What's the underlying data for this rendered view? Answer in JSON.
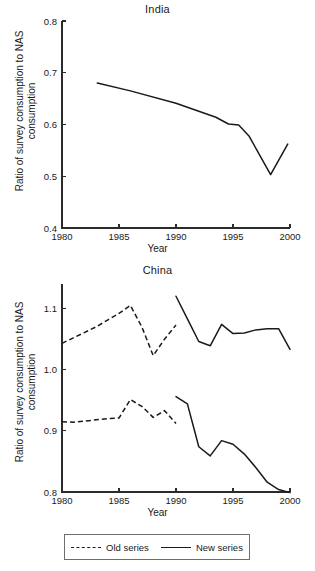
{
  "figure": {
    "axis_label_y_line1": "Ratio of survey consumption to NAS",
    "axis_label_y_line2": "consumption",
    "axis_label_x": "Year"
  },
  "legend": {
    "old_label": "Old series",
    "new_label": "New series"
  },
  "chart_data": [
    {
      "type": "line",
      "title": "India",
      "xlabel": "Year",
      "ylabel": "Ratio of survey consumption to NAS consumption",
      "xlim": [
        1980,
        2000
      ],
      "ylim": [
        0.4,
        0.8
      ],
      "xticks": [
        1980,
        1985,
        1990,
        1995,
        2000
      ],
      "xticklabels": [
        "1980",
        "1985",
        "1990",
        "1995",
        "2000"
      ],
      "yticks": [
        0.4,
        0.5,
        0.6,
        0.7,
        0.8
      ],
      "yticklabels": [
        "0.4",
        "0.5",
        "0.6",
        "0.7",
        "0.8"
      ],
      "grid": false,
      "legend_position": "none",
      "series": [
        {
          "name": "India ratio",
          "style": "solid",
          "x": [
            1983.1,
            1986.0,
            1990.0,
            1993.5,
            1994.6,
            1995.5,
            1996.4,
            1998.3,
            1999.8
          ],
          "values": [
            0.68,
            0.665,
            0.641,
            0.614,
            0.601,
            0.599,
            0.578,
            0.503,
            0.562
          ]
        }
      ]
    },
    {
      "type": "line",
      "title": "China",
      "xlabel": "Year",
      "ylabel": "Ratio of survey consumption to NAS consumption",
      "xlim": [
        1980,
        2000
      ],
      "ylim": [
        0.8,
        1.14
      ],
      "xticks": [
        1980,
        1985,
        1990,
        1995,
        2000
      ],
      "xticklabels": [
        "1980",
        "1985",
        "1990",
        "1995",
        "2000"
      ],
      "yticks": [
        0.8,
        0.9,
        1.0,
        1.1
      ],
      "yticklabels": [
        "0.8",
        "0.9",
        "1.0",
        "1.1"
      ],
      "grid": false,
      "legend_position": "bottom",
      "series": [
        {
          "name": "Old series (urban, upper)",
          "style": "dashed",
          "x": [
            1980,
            1981,
            1982,
            1983,
            1984,
            1985,
            1986,
            1987,
            1988,
            1989,
            1990
          ],
          "values": [
            1.043,
            1.052,
            1.061,
            1.07,
            1.081,
            1.092,
            1.105,
            1.07,
            1.023,
            1.05,
            1.073
          ]
        },
        {
          "name": "New series (urban, upper)",
          "style": "solid",
          "x": [
            1990,
            1991,
            1992,
            1993,
            1994,
            1995,
            1996,
            1997,
            1998,
            1999,
            2000
          ],
          "values": [
            1.12,
            1.083,
            1.046,
            1.039,
            1.074,
            1.059,
            1.06,
            1.065,
            1.067,
            1.067,
            1.033
          ]
        },
        {
          "name": "Old series (rural, lower)",
          "style": "dashed",
          "x": [
            1980,
            1981,
            1982,
            1983,
            1984,
            1985,
            1986,
            1987,
            1988,
            1989,
            1990
          ],
          "values": [
            0.915,
            0.914,
            0.916,
            0.918,
            0.92,
            0.921,
            0.951,
            0.94,
            0.922,
            0.933,
            0.912
          ]
        },
        {
          "name": "New series (rural, lower)",
          "style": "solid",
          "x": [
            1990,
            1991,
            1992,
            1993,
            1994,
            1995,
            1996,
            1997,
            1998,
            1999,
            2000
          ],
          "values": [
            0.956,
            0.944,
            0.874,
            0.859,
            0.884,
            0.878,
            0.862,
            0.84,
            0.816,
            0.804,
            0.799
          ]
        }
      ]
    }
  ]
}
